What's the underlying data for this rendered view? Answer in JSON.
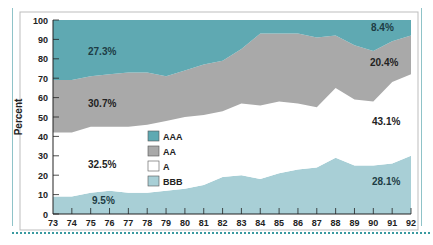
{
  "chart_data": {
    "type": "area",
    "stacked": true,
    "title": "",
    "xlabel": "",
    "ylabel": "Percent",
    "ylim": [
      0,
      100
    ],
    "yticks": [
      0,
      10,
      20,
      30,
      40,
      50,
      60,
      70,
      80,
      90,
      100
    ],
    "categories": [
      "73",
      "74",
      "75",
      "76",
      "77",
      "78",
      "79",
      "80",
      "81",
      "82",
      "83",
      "84",
      "85",
      "86",
      "87",
      "88",
      "89",
      "90",
      "91",
      "92"
    ],
    "series": [
      {
        "name": "BBB",
        "color": "#a8cfd6",
        "values": [
          9,
          9,
          11,
          12,
          11,
          11,
          12,
          13,
          15,
          19,
          20,
          18,
          21,
          23,
          24,
          29,
          25,
          25,
          26,
          30
        ]
      },
      {
        "name": "A",
        "color": "#ffffff",
        "values": [
          33,
          33,
          34,
          33,
          34,
          35,
          36,
          37,
          36,
          34,
          37,
          38,
          37,
          34,
          31,
          36,
          34,
          33,
          42,
          42
        ]
      },
      {
        "name": "AA",
        "color": "#a9a9a9",
        "values": [
          27,
          27,
          26,
          27,
          28,
          27,
          23,
          24,
          26,
          26,
          28,
          37,
          35,
          36,
          36,
          27,
          28,
          26,
          21,
          20
        ]
      },
      {
        "name": "AAA",
        "color": "#5fa9b2",
        "values": [
          31,
          31,
          29,
          28,
          27,
          27,
          29,
          26,
          23,
          21,
          15,
          7,
          7,
          7,
          9,
          8,
          13,
          16,
          11,
          8
        ]
      }
    ],
    "annotations": [
      {
        "text": "27.3%",
        "series": "AAA",
        "x": "75"
      },
      {
        "text": "30.7%",
        "series": "AA",
        "x": "75"
      },
      {
        "text": "32.5%",
        "series": "A",
        "x": "75"
      },
      {
        "text": "9.5%",
        "series": "BBB",
        "x": "75"
      },
      {
        "text": "8.4%",
        "series": "AAA",
        "x": "91"
      },
      {
        "text": "20.4%",
        "series": "AA",
        "x": "91"
      },
      {
        "text": "43.1%",
        "series": "A",
        "x": "91"
      },
      {
        "text": "28.1%",
        "series": "BBB",
        "x": "91"
      }
    ],
    "legend": {
      "position": "inside-center-left",
      "entries": [
        "AAA",
        "AA",
        "A",
        "BBB"
      ]
    },
    "grid": false
  },
  "labels": {
    "ylabel": "Percent",
    "legend": [
      "AAA",
      "AA",
      "A",
      "BBB"
    ],
    "ann_aaa_start": "27.3%",
    "ann_aa_start": "30.7%",
    "ann_a_start": "32.5%",
    "ann_bbb_start": "9.5%",
    "ann_aaa_end": "8.4%",
    "ann_aa_end": "20.4%",
    "ann_a_end": "43.1%",
    "ann_bbb_end": "28.1%"
  }
}
